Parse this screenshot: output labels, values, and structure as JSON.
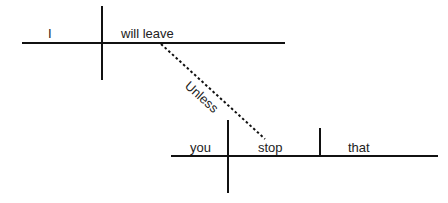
{
  "diagram": {
    "type": "sentence-diagram",
    "main_clause": {
      "subject": "I",
      "predicate": "will leave"
    },
    "connector": {
      "label": "Unless"
    },
    "sub_clause": {
      "subject": "you",
      "predicate": "stop",
      "object": "that"
    }
  }
}
